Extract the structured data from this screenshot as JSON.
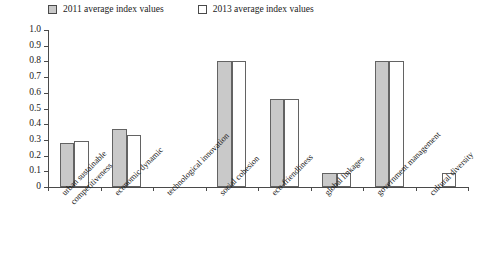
{
  "chart_data": {
    "type": "bar",
    "title": "",
    "xlabel": "",
    "ylabel": "",
    "ylim": [
      0,
      1.0
    ],
    "grid": false,
    "legend_position": "top-left",
    "ytick_labels": [
      "1.0",
      "0.9",
      "0.8",
      "0.7",
      "0.6",
      "0.5",
      "0.4",
      "0.3",
      "0.2",
      "0.1",
      "0"
    ],
    "ytick_values": [
      1.0,
      0.9,
      0.8,
      0.7,
      0.6,
      0.5,
      0.4,
      0.3,
      0.2,
      0.1,
      0
    ],
    "categories": [
      "urban sustainable competitiveness",
      "economic dynamic",
      "technological innovation",
      "social cohesion",
      "eco-friendliness",
      "global linkages",
      "government management",
      "cultural diversity"
    ],
    "category_lines": [
      [
        "urban sustainable",
        "competitiveness"
      ],
      [
        "economic dynamic"
      ],
      [
        "technological innovation"
      ],
      [
        "social cohesion"
      ],
      [
        "eco-friendliness"
      ],
      [
        "global linkages"
      ],
      [
        "government management"
      ],
      [
        "cultural diversity"
      ]
    ],
    "series": [
      {
        "name": "2011 average index values",
        "color": "#c9c9c9",
        "values": [
          0.28,
          0.37,
          0.0,
          0.8,
          0.56,
          0.09,
          0.8,
          0.0
        ]
      },
      {
        "name": "2013 average index values",
        "color": "#ffffff",
        "values": [
          0.29,
          0.33,
          0.0,
          0.8,
          0.56,
          0.09,
          0.8,
          0.09
        ]
      }
    ]
  },
  "legend": {
    "items": [
      {
        "label": "2011 average index values",
        "swatch": "filled-gray-swatch"
      },
      {
        "label": "2013 average index values",
        "swatch": "empty-white-swatch"
      }
    ]
  }
}
